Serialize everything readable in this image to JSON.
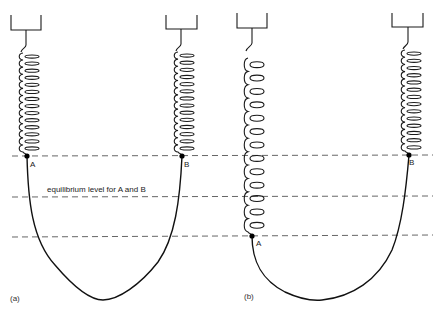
{
  "diagram": {
    "annotation": "equilibrium level for A and B",
    "panels": [
      {
        "id": "a",
        "caption": "(a)",
        "point_a_label": "A",
        "point_b_label": "B",
        "spring_a": {
          "coils": 14,
          "top": 53,
          "bottom": 152,
          "cx": 27
        },
        "spring_b": {
          "coils": 14,
          "top": 52,
          "bottom": 152,
          "cx": 182
        },
        "point_a": [
          27,
          156
        ],
        "point_b": [
          182,
          156
        ],
        "rope_bottom": [
          103,
          300
        ]
      },
      {
        "id": "b",
        "caption": "(b)",
        "point_a_label": "A",
        "point_b_label": "B",
        "spring_a": {
          "coils": 13,
          "top": 58,
          "bottom": 232,
          "cx": 252
        },
        "spring_b": {
          "coils": 14,
          "top": 50,
          "bottom": 151,
          "cx": 409
        },
        "point_a": [
          252,
          236
        ],
        "point_b": [
          409,
          155
        ],
        "rope_bottom": [
          320,
          300
        ]
      }
    ],
    "dashed_levels_y": [
      156,
      197,
      237
    ],
    "colors": {
      "ink": "#1a1a1a",
      "dash": "#555555",
      "background": "#ffffff"
    }
  }
}
